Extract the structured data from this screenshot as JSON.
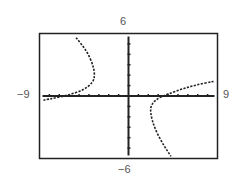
{
  "chart_data": {
    "type": "line",
    "title": "",
    "xlabel": "",
    "ylabel": "",
    "window": {
      "xmin": -9,
      "xmax": 9,
      "ymin": -6,
      "ymax": 6
    },
    "xlim": [
      -9,
      9
    ],
    "ylim": [
      -6,
      6
    ],
    "tick_step": 1,
    "grid": false,
    "legend": null,
    "window_labels": {
      "top": "6",
      "bottom": "-6",
      "left": "-9",
      "right": "9"
    },
    "series": [
      {
        "name": "upper-left branch",
        "style": "dotted",
        "x": [
          -8.6,
          -7.5,
          -6.0,
          -4.5,
          -3.6,
          -3.4,
          -3.6,
          -4.2,
          -5.3
        ],
        "y": [
          -0.4,
          -0.2,
          0.1,
          0.6,
          1.3,
          2.0,
          3.0,
          4.3,
          5.6
        ]
      },
      {
        "name": "lower-right branch",
        "style": "dotted",
        "x": [
          8.6,
          7.0,
          5.5,
          4.0,
          3.0,
          2.3,
          2.2,
          2.6,
          3.4,
          4.3
        ],
        "y": [
          1.4,
          1.1,
          0.7,
          0.2,
          -0.2,
          -0.8,
          -1.6,
          -3.0,
          -4.5,
          -5.8
        ]
      }
    ]
  },
  "colors": {
    "curve": "#222222",
    "frame": "#222222",
    "labels": "#555555"
  }
}
